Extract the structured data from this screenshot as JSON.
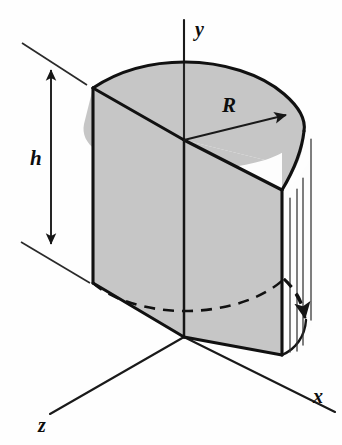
{
  "figure": {
    "background_color": "#fefefe",
    "line_color": "#141414",
    "shaded_face_color": "#c6c6c6",
    "unshaded_face_color": "#fdfdfd"
  },
  "labels": {
    "axis_y": "y",
    "axis_x": "x",
    "axis_z": "z",
    "radius": "R",
    "height": "h"
  },
  "geometry": {
    "origin": {
      "x": 184,
      "y": 337
    },
    "top_center": {
      "x": 184,
      "y": 140
    },
    "height_px": 197,
    "radius_px": 104,
    "back_left_top_corner": {
      "x": 93,
      "y": 88
    },
    "back_left_bottom_corner": {
      "x": 93,
      "y": 283
    },
    "right_top_corner": {
      "x": 282,
      "y": 190
    },
    "right_bottom_corner": {
      "x": 282,
      "y": 355
    }
  },
  "annotations": {
    "radius_arrow_from": {
      "x": 184,
      "y": 140
    },
    "radius_arrow_to": {
      "x": 289,
      "y": 113
    },
    "height_dimension_top": {
      "x": 51,
      "y": 68
    },
    "height_dimension_bottom": {
      "x": 51,
      "y": 246
    }
  }
}
